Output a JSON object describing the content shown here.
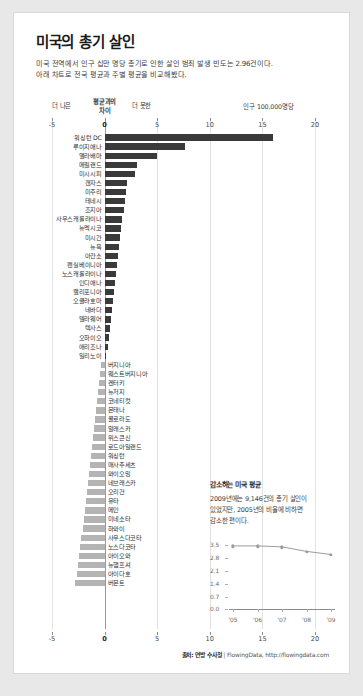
{
  "header": {
    "title": "미국의 총기 살인",
    "subtitle_line1": "미국 전역에서 인구 십만 명당 총기로 인한 살인 범죄 발생 빈도는 2.96건이다.",
    "subtitle_line2": "아래 차트로 전국 평균과 주별 평균을 비교해봤다."
  },
  "annotations": {
    "better": "더 나은",
    "axis_name": "평균과의\n차이",
    "axis_name_l1": "평균과의",
    "axis_name_l2": "차이",
    "worse": "더 못한",
    "unit": "인구 100,000명당"
  },
  "footer": {
    "source_label": "출처: 연방 수사청",
    "separator": " | ",
    "credit": "FlowingData, http://flowingdata.com"
  },
  "inset": {
    "title": "감소하는 미국 평균",
    "body_line1": "2009년에는 9,146건의 총기 살인이",
    "body_line2": "있었지만, 2005년의 비율에 비하면",
    "body_line3": "감소한 편이다."
  },
  "chart_data": {
    "type": "bar",
    "title": "미국의 총기 살인",
    "xlabel": "평균과의 차이",
    "ylabel": "",
    "unit": "인구 100,000명당",
    "orientation": "horizontal",
    "xlim": [
      -5,
      20
    ],
    "xticks": [
      -5,
      0,
      5,
      10,
      15,
      20
    ],
    "grid": true,
    "national_average": 2.96,
    "categories": [
      "워싱턴 DC",
      "루이지애나",
      "앨라배마",
      "메릴랜드",
      "미시시피",
      "캔자스",
      "미주리",
      "테네시",
      "조지아",
      "사우스캐롤라이나",
      "뉴멕시코",
      "미시간",
      "뉴욕",
      "아칸소",
      "펜실베이니아",
      "노스캐롤라이나",
      "인디애나",
      "캘리포니아",
      "오클라호마",
      "네바다",
      "델라웨어",
      "텍사스",
      "오하이오",
      "애리조나",
      "일리노이",
      "버지니아",
      "웨스트버지니아",
      "켄터키",
      "뉴저지",
      "코네티컷",
      "몬태나",
      "콜로라도",
      "알래스카",
      "위스콘신",
      "로드아일랜드",
      "워싱턴",
      "매사추세츠",
      "와이오밍",
      "네브래스카",
      "오리건",
      "유타",
      "메인",
      "미네소타",
      "하와이",
      "사우스다코타",
      "노스다코타",
      "아이오와",
      "뉴햄프셔",
      "아이다호",
      "버몬트"
    ],
    "values": [
      16.0,
      7.6,
      5.0,
      3.1,
      2.9,
      2.1,
      2.0,
      1.9,
      1.8,
      1.7,
      1.6,
      1.5,
      1.4,
      1.3,
      1.2,
      1.1,
      1.0,
      0.9,
      0.8,
      0.7,
      0.6,
      0.5,
      0.4,
      0.3,
      0.15,
      -0.3,
      -0.4,
      -0.5,
      -0.6,
      -0.7,
      -0.8,
      -0.9,
      -1.0,
      -1.1,
      -1.2,
      -1.3,
      -1.4,
      -1.5,
      -1.6,
      -1.7,
      -1.8,
      -1.9,
      -2.0,
      -2.1,
      -2.2,
      -2.3,
      -2.4,
      -2.5,
      -2.6,
      -2.8
    ]
  },
  "inset_chart_data": {
    "type": "line",
    "title": "감소하는 미국 평균",
    "x": [
      "'05",
      "'06",
      "'07",
      "'08",
      "'09"
    ],
    "values": [
      3.45,
      3.45,
      3.4,
      3.15,
      2.98
    ],
    "yticks": [
      0.0,
      0.7,
      1.4,
      2.1,
      2.8,
      3.5
    ],
    "ylim": [
      0.0,
      3.5
    ],
    "grid": false
  }
}
